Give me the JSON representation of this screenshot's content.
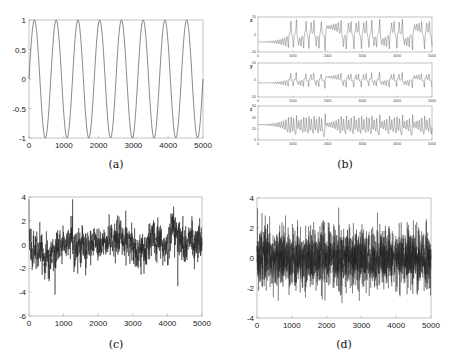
{
  "chart_data": [
    {
      "id": "a",
      "type": "line",
      "caption": "(a)",
      "title": "",
      "xlabel": "",
      "ylabel": "",
      "description": "Pure sinusoid, ~8 periods across 5000 samples",
      "series": [
        {
          "name": "sine",
          "function": "sin(2*pi*x/625)",
          "amplitude": 1,
          "period": 625
        }
      ],
      "xlim": [
        0,
        5000
      ],
      "ylim": [
        -1,
        1
      ],
      "xticks": [
        "0",
        "1000",
        "2000",
        "3000",
        "4000",
        "5000"
      ],
      "yticks": [
        "-1",
        "-0.5",
        "0",
        "0.5",
        "1"
      ],
      "grid": false,
      "line_color": "#555555"
    },
    {
      "id": "b",
      "type": "line",
      "caption": "(b)",
      "title": "",
      "description": "Lorenz system components x, y, z vs time (three stacked panels); small transient oscillations growing until ~1700, then chaotic switching",
      "panels": [
        {
          "ylabel": "x",
          "ylim": [
            -20,
            20
          ],
          "yticks": [
            "-20",
            "0",
            "20"
          ],
          "xlim": [
            0,
            5000
          ],
          "xticks": [
            "0",
            "1000",
            "2000",
            "3000",
            "4000",
            "5000"
          ]
        },
        {
          "ylabel": "y",
          "ylim": [
            -50,
            50
          ],
          "yticks": [
            "-50",
            "0",
            "50"
          ],
          "xlim": [
            0,
            5000
          ],
          "xticks": [
            "0",
            "1000",
            "2000",
            "3000",
            "4000",
            "5000"
          ]
        },
        {
          "ylabel": "z",
          "ylim": [
            0,
            60
          ],
          "yticks": [
            "0",
            "20",
            "40",
            "60"
          ],
          "xlim": [
            0,
            5000
          ],
          "xticks": [
            "0",
            "1000",
            "2000",
            "3000",
            "4000",
            "5000"
          ]
        }
      ],
      "grid": false,
      "line_color": "#333333"
    },
    {
      "id": "c",
      "type": "line",
      "caption": "(c)",
      "description": "Noisy random-walk-like signal (colored noise), mean near 0, dips to about -4.2 near x=750, peak ~3.8 near x=1250",
      "xlim": [
        0,
        5000
      ],
      "ylim": [
        -6,
        4
      ],
      "xticks": [
        "0",
        "1000",
        "2000",
        "3000",
        "4000",
        "5000"
      ],
      "yticks": [
        "-6",
        "-4",
        "-2",
        "0",
        "2",
        "4"
      ],
      "approx_envelope": {
        "min": -4.2,
        "max": 3.8,
        "mean": 0
      },
      "grid": false,
      "line_color": "#222222"
    },
    {
      "id": "d",
      "type": "line",
      "caption": "(d)",
      "description": "White Gaussian noise, mean 0, std ~1, range approx -3.7 to 3.4",
      "xlim": [
        0,
        5000
      ],
      "ylim": [
        -4,
        4
      ],
      "xticks": [
        "0",
        "1000",
        "2000",
        "3000",
        "4000",
        "5000"
      ],
      "yticks": [
        "-4",
        "-2",
        "0",
        "2",
        "4"
      ],
      "approx_envelope": {
        "min": -3.7,
        "max": 3.4,
        "mean": 0,
        "std": 1
      },
      "grid": false,
      "line_color": "#222222"
    }
  ],
  "captions": {
    "a": "(a)",
    "b": "(b)",
    "c": "(c)",
    "d": "(d)"
  }
}
